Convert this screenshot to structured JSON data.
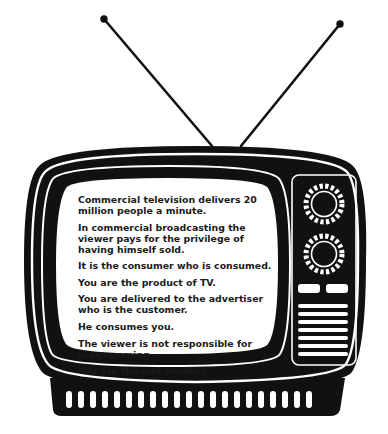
{
  "illustration": {
    "subject": "vintage television set with rabbit-ear antenna",
    "colors": {
      "ink": "#111111",
      "screen": "#ffffff",
      "background": "#ffffff"
    },
    "controls": {
      "dials": 2,
      "buttons": 2,
      "speaker_slats": 7
    },
    "base_vents": 21
  },
  "screen": {
    "lines": [
      "Commercial television delivers 20 million people a minute.",
      "In commercial broadcasting the viewer pays for the privilege of having himself sold.",
      "It is the consumer who is consumed.",
      "You are the product of TV.",
      "You are delivered to the advertiser who is the customer.",
      "He consumes you.",
      "The viewer is not responsible for programming—",
      "You are the end product."
    ]
  }
}
